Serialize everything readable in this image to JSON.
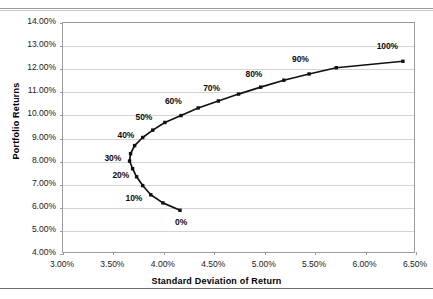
{
  "chart_data": {
    "type": "line",
    "title": "",
    "xlabel": "Standard Deviation of Return",
    "ylabel": "Portfolio Returns",
    "xlim": [
      3.0,
      6.5
    ],
    "ylim": [
      4.0,
      14.0
    ],
    "xticks": [
      "3.00%",
      "3.50%",
      "4.00%",
      "4.50%",
      "5.00%",
      "5.50%",
      "6.00%",
      "6.50%"
    ],
    "xtick_values": [
      3.0,
      3.5,
      4.0,
      4.5,
      5.0,
      5.5,
      6.0,
      6.5
    ],
    "yticks": [
      "4.00%",
      "5.00%",
      "6.00%",
      "7.00%",
      "8.00%",
      "9.00%",
      "10.00%",
      "11.00%",
      "12.00%",
      "13.00%",
      "14.00%"
    ],
    "ytick_values": [
      4.0,
      5.0,
      6.0,
      7.0,
      8.0,
      9.0,
      10.0,
      11.0,
      12.0,
      13.0,
      14.0
    ],
    "grid": "horizontal",
    "legend": "none",
    "series_name": "Efficient Frontier",
    "marker": "square",
    "marker_color": "#111111",
    "line_color": "#111111",
    "points": [
      {
        "weight": "0%",
        "x": 4.17,
        "y": 5.85,
        "label": "0%"
      },
      {
        "weight": "5%",
        "x": 4.0,
        "y": 6.17,
        "label": ""
      },
      {
        "weight": "10%",
        "x": 3.88,
        "y": 6.52,
        "label": "10%"
      },
      {
        "weight": "15%",
        "x": 3.8,
        "y": 6.92,
        "label": ""
      },
      {
        "weight": "20%",
        "x": 3.74,
        "y": 7.3,
        "label": "20%"
      },
      {
        "weight": "25%",
        "x": 3.7,
        "y": 7.65,
        "label": ""
      },
      {
        "weight": "30%",
        "x": 3.67,
        "y": 7.98,
        "label": "30%"
      },
      {
        "weight": "35%",
        "x": 3.68,
        "y": 8.3,
        "label": ""
      },
      {
        "weight": "40%",
        "x": 3.72,
        "y": 8.65,
        "label": "40%"
      },
      {
        "weight": "45%",
        "x": 3.8,
        "y": 9.0,
        "label": ""
      },
      {
        "weight": "50%",
        "x": 3.9,
        "y": 9.32,
        "label": "50%"
      },
      {
        "weight": "55%",
        "x": 4.02,
        "y": 9.65,
        "label": ""
      },
      {
        "weight": "60%",
        "x": 4.18,
        "y": 9.95,
        "label": "60%"
      },
      {
        "weight": "65%",
        "x": 4.35,
        "y": 10.28,
        "label": ""
      },
      {
        "weight": "70%",
        "x": 4.55,
        "y": 10.58,
        "label": "70%"
      },
      {
        "weight": "75%",
        "x": 4.75,
        "y": 10.88,
        "label": ""
      },
      {
        "weight": "80%",
        "x": 4.97,
        "y": 11.18,
        "label": "80%"
      },
      {
        "weight": "85%",
        "x": 5.2,
        "y": 11.48,
        "label": ""
      },
      {
        "weight": "90%",
        "x": 5.45,
        "y": 11.75,
        "label": "90%"
      },
      {
        "weight": "95%",
        "x": 5.72,
        "y": 12.02,
        "label": ""
      },
      {
        "weight": "100%",
        "x": 6.38,
        "y": 12.3,
        "label": "100%"
      }
    ],
    "point_labels": [
      {
        "text": "0%",
        "x": 4.12,
        "y": 5.3
      },
      {
        "text": "10%",
        "x": 3.63,
        "y": 6.35
      },
      {
        "text": "20%",
        "x": 3.5,
        "y": 7.35
      },
      {
        "text": "30%",
        "x": 3.42,
        "y": 8.08
      },
      {
        "text": "40%",
        "x": 3.55,
        "y": 9.08
      },
      {
        "text": "50%",
        "x": 3.73,
        "y": 9.85
      },
      {
        "text": "60%",
        "x": 4.02,
        "y": 10.55
      },
      {
        "text": "70%",
        "x": 4.4,
        "y": 11.12
      },
      {
        "text": "80%",
        "x": 4.82,
        "y": 11.7
      },
      {
        "text": "90%",
        "x": 5.28,
        "y": 12.35
      },
      {
        "text": "100%",
        "x": 6.12,
        "y": 12.92
      }
    ]
  }
}
